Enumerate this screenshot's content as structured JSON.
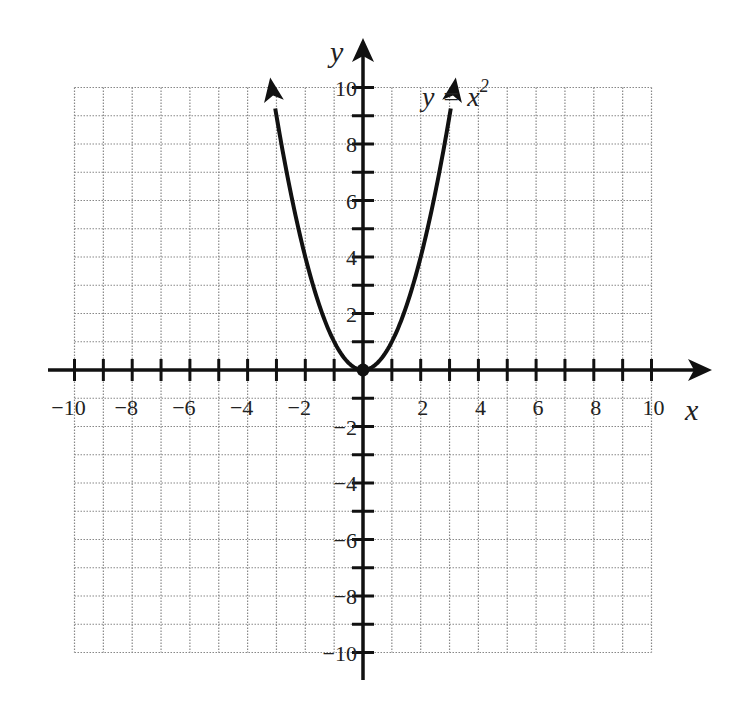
{
  "chart_data": {
    "type": "line",
    "title": "",
    "xlabel": "x",
    "ylabel": "y",
    "xlim": [
      -10,
      10
    ],
    "ylim": [
      -10,
      10
    ],
    "grid": true,
    "grid_step": 1,
    "x_tick_labels": [
      "-10",
      "-8",
      "-6",
      "-4",
      "-2",
      "2",
      "4",
      "6",
      "8",
      "10"
    ],
    "y_tick_labels": [
      "10",
      "8",
      "6",
      "4",
      "2",
      "-2",
      "-4",
      "-6",
      "-8",
      "-10"
    ],
    "series": [
      {
        "name": "y = x^2",
        "function": "x^2",
        "x": [
          -3.16,
          -3,
          -2.5,
          -2,
          -1.5,
          -1,
          -0.5,
          0,
          0.5,
          1,
          1.5,
          2,
          2.5,
          3,
          3.16
        ],
        "y": [
          10,
          9,
          6.25,
          4,
          2.25,
          1,
          0.25,
          0,
          0.25,
          1,
          2.25,
          4,
          6.25,
          9,
          10
        ],
        "arrows_at_ends": true
      }
    ],
    "points": [
      {
        "x": 0,
        "y": 0,
        "label": "vertex"
      }
    ],
    "annotations": [
      {
        "text": "y = x",
        "superscript": "2",
        "x": 2.1,
        "y": 10.3
      }
    ]
  },
  "labels": {
    "x_axis": "x",
    "y_axis": "y",
    "equation_main": "y = x",
    "equation_sup": "2"
  },
  "colors": {
    "curve": "#111111",
    "axis": "#111111",
    "grid": "#888888",
    "text": "#222222"
  }
}
